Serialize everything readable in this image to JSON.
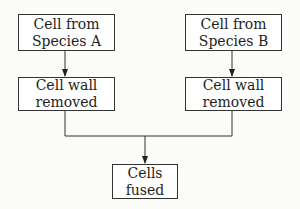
{
  "diagram": {
    "type": "flowchart",
    "nodes": [
      {
        "id": "species_a",
        "lines": [
          "Cell from",
          "Species A"
        ]
      },
      {
        "id": "species_b",
        "lines": [
          "Cell from",
          "Species B"
        ]
      },
      {
        "id": "wall_removed_a",
        "lines": [
          "Cell wall",
          "removed"
        ]
      },
      {
        "id": "wall_removed_b",
        "lines": [
          "Cell wall",
          "removed"
        ]
      },
      {
        "id": "fused",
        "lines": [
          "Cells",
          "fused"
        ]
      }
    ],
    "edges": [
      {
        "from": "species_a",
        "to": "wall_removed_a"
      },
      {
        "from": "species_b",
        "to": "wall_removed_b"
      },
      {
        "from": "wall_removed_a",
        "to": "fused"
      },
      {
        "from": "wall_removed_b",
        "to": "fused"
      }
    ]
  },
  "colors": {
    "line": "#333333",
    "box_fill": "#ffffff",
    "background": "#fbfbf8"
  }
}
